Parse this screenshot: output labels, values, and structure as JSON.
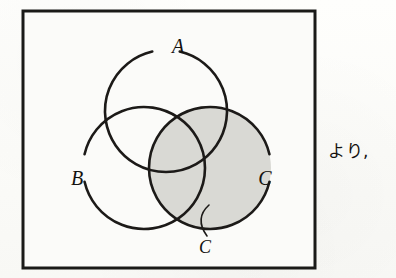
{
  "figure": {
    "kind": "venn-diagram",
    "universe_box": {
      "name": "universal-set-box",
      "x": 23,
      "y": 11,
      "width": 292,
      "height": 257,
      "stroke_color": "#1a1a18",
      "stroke_width": 3,
      "fill_color": "#fbfbf9"
    },
    "circles": [
      {
        "id": "A",
        "label": "A",
        "cx": 166,
        "cy": 111,
        "r": 61,
        "gap_center_deg": -90,
        "gap_span_deg": 26,
        "label_x": 178,
        "label_y": 48,
        "filled": false,
        "fill_color": "none",
        "stroke_color": "#1c1a18",
        "stroke_width": 2.6
      },
      {
        "id": "B",
        "label": "B",
        "cx": 144,
        "cy": 168,
        "r": 61,
        "gap_center_deg": 180,
        "gap_span_deg": 26,
        "label_x": 77,
        "label_y": 180,
        "filled": false,
        "fill_color": "none",
        "stroke_color": "#1c1a18",
        "stroke_width": 2.6
      },
      {
        "id": "C",
        "label": "C",
        "cx": 210,
        "cy": 168,
        "r": 61,
        "gap_center_deg": 0,
        "gap_span_deg": 26,
        "label_x": 265,
        "label_y": 180,
        "filled": true,
        "fill_color": "#d9d9d4",
        "stroke_color": "#1c1a18",
        "stroke_width": 2.6
      }
    ],
    "callout": {
      "name": "callout-c",
      "label": "C",
      "label_x": 205,
      "label_y": 249,
      "leader_path": "M 207 236 C 199 225, 199 214, 209 205"
    },
    "shading": {
      "region": "C",
      "color": "#d9d9d4"
    }
  },
  "side_text": {
    "value": "より,"
  }
}
